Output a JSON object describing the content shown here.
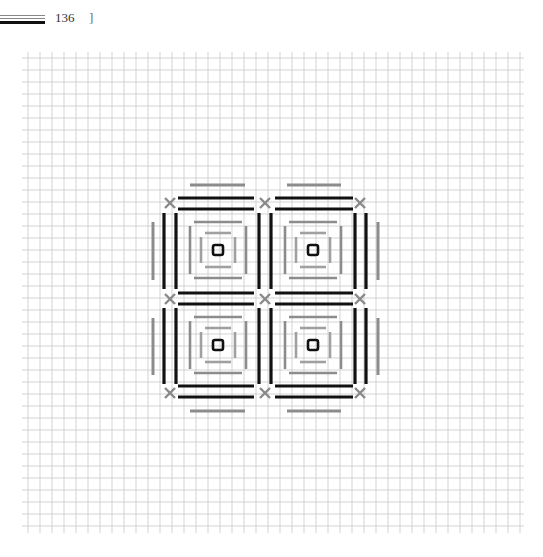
{
  "page": {
    "number": "136",
    "bracket": "]"
  },
  "grid": {
    "x0": 22,
    "y0": 52,
    "x1": 524,
    "y1": 533,
    "spacing": 12,
    "line_color": "#c8c8c8"
  },
  "pattern": {
    "description": "Cross-stitch / needlepoint chart: 2x2 block of concentric square motifs",
    "colors": {
      "black": "#111111",
      "gray": "#8c8c8c",
      "cross": "#8a8a8a"
    },
    "cross_marks": [
      [
        170,
        203
      ],
      [
        265,
        203
      ],
      [
        360,
        203
      ],
      [
        170,
        299
      ],
      [
        265,
        299
      ],
      [
        360,
        299
      ],
      [
        170,
        393
      ],
      [
        265,
        393
      ],
      [
        360,
        393
      ]
    ],
    "black_h_lines": [
      [
        178,
        198,
        254,
        198
      ],
      [
        275,
        198,
        353,
        198
      ],
      [
        178,
        209,
        254,
        209
      ],
      [
        275,
        209,
        353,
        209
      ],
      [
        178,
        293,
        254,
        293
      ],
      [
        275,
        293,
        353,
        293
      ],
      [
        178,
        304,
        254,
        304
      ],
      [
        275,
        304,
        353,
        304
      ],
      [
        178,
        386,
        254,
        386
      ],
      [
        275,
        386,
        353,
        386
      ],
      [
        178,
        397,
        254,
        397
      ],
      [
        275,
        397,
        353,
        397
      ]
    ],
    "black_v_lines": [
      [
        164,
        213,
        164,
        289
      ],
      [
        176,
        213,
        176,
        289
      ],
      [
        259,
        213,
        259,
        289
      ],
      [
        271,
        213,
        271,
        289
      ],
      [
        355,
        213,
        355,
        289
      ],
      [
        366,
        213,
        366,
        289
      ],
      [
        164,
        308,
        164,
        384
      ],
      [
        176,
        308,
        176,
        384
      ],
      [
        259,
        308,
        259,
        384
      ],
      [
        271,
        308,
        271,
        384
      ],
      [
        355,
        308,
        355,
        384
      ],
      [
        366,
        308,
        366,
        384
      ]
    ],
    "gray_outer_lines": [
      [
        190,
        185,
        245,
        185
      ],
      [
        287,
        185,
        341,
        185
      ],
      [
        190,
        411,
        245,
        411
      ],
      [
        287,
        411,
        341,
        411
      ],
      [
        153,
        222,
        153,
        280
      ],
      [
        153,
        318,
        153,
        375
      ],
      [
        378,
        222,
        378,
        280
      ],
      [
        378,
        318,
        378,
        375
      ]
    ],
    "motif_centers": [
      [
        218,
        250
      ],
      [
        313,
        250
      ],
      [
        218,
        345
      ],
      [
        313,
        345
      ]
    ],
    "inner_ring_half_sizes": [
      28,
      17
    ],
    "center_square_half": 5
  }
}
